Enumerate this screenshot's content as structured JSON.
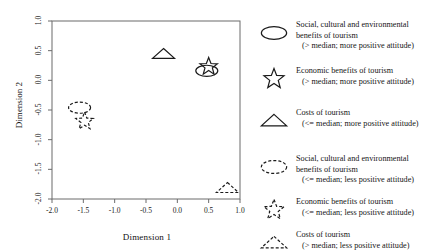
{
  "chart_data": {
    "type": "scatter",
    "title": "",
    "xlabel": "Dimension 1",
    "ylabel": "Dimension 2",
    "xlim": [
      -2.0,
      1.0
    ],
    "ylim": [
      -2.0,
      1.0
    ],
    "xticks": [
      "-2.0",
      "-1.5",
      "-1.0",
      "-0.5",
      "0.0",
      "0.5",
      "1.0"
    ],
    "xtick_values": [
      -2.0,
      -1.5,
      -1.0,
      -0.5,
      0.0,
      0.5,
      1.0
    ],
    "yticks": [
      "1.0",
      "0.5",
      "0.0",
      "-0.5",
      "-1.0",
      "-1.5",
      "-2.0"
    ],
    "ytick_values": [
      1.0,
      0.5,
      0.0,
      -0.5,
      -1.0,
      -1.5,
      -2.0
    ],
    "grid": false,
    "legend_position": "right",
    "points": [
      {
        "id": "social-high",
        "marker": "ellipse",
        "style": "solid",
        "x": 0.47,
        "y": 0.16,
        "label": "Social, cultural and environmental benefits of tourism (> median; more positive attitude)"
      },
      {
        "id": "economic-high",
        "marker": "star",
        "style": "solid",
        "x": 0.5,
        "y": 0.23,
        "label": "Economic benefits of tourism (> median; more positive attitude)"
      },
      {
        "id": "costs-low",
        "marker": "triangle",
        "style": "solid",
        "x": -0.22,
        "y": 0.44,
        "label": "Costs of tourism (<= median; more positive attitude)"
      },
      {
        "id": "social-low",
        "marker": "ellipse",
        "style": "dashed",
        "x": -1.56,
        "y": -0.46,
        "label": "Social, cultural and environmental benefits of tourism (<= median; less positive attitude)"
      },
      {
        "id": "economic-low",
        "marker": "star",
        "style": "dashed",
        "x": -1.48,
        "y": -0.69,
        "label": "Economic benefits of tourism (<= median; less positive attitude)"
      },
      {
        "id": "costs-high",
        "marker": "triangle",
        "style": "dashed",
        "x": 0.8,
        "y": -1.82,
        "label": "Costs of tourism (> median; less positive attitude)"
      }
    ]
  },
  "axes": {
    "x_title": "Dimension 1",
    "y_title": "Dimension 2"
  },
  "legend": {
    "items": [
      {
        "symbol": "ellipse-solid-icon",
        "line1": "Social, cultural and environmental",
        "line2": "benefits of  tourism",
        "line3": "(> median; more positive attitude)"
      },
      {
        "symbol": "star-solid-icon",
        "line1": "Economic benefits of  tourism",
        "line2": "(> median; more positive attitude)",
        "line3": ""
      },
      {
        "symbol": "triangle-solid-icon",
        "line1": "Costs of  tourism",
        "line2": "(<= median; more positive attitude)",
        "line3": ""
      },
      {
        "symbol": "ellipse-dashed-icon",
        "line1": "Social, cultural and environmental",
        "line2": "benefits of  tourism",
        "line3": "(<= median; less positive attitude)"
      },
      {
        "symbol": "star-dashed-icon",
        "line1": "Economic benefits of  tourism",
        "line2": "(<= median; less positive attitude)",
        "line3": ""
      },
      {
        "symbol": "triangle-dashed-icon",
        "line1": "Costs of  tourism",
        "line2": "(> median; less positive attitude)",
        "line3": ""
      }
    ]
  }
}
